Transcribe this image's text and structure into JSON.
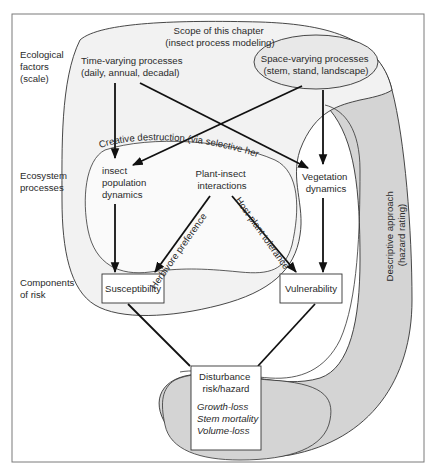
{
  "diagram": {
    "scale_labels": {
      "ecological_factors": [
        "Ecological",
        "factors",
        "(scale)"
      ],
      "ecosystem_processes": [
        "Ecosystem",
        "processes"
      ],
      "components_of_risk": [
        "Components",
        "of risk"
      ]
    },
    "scope": {
      "line1": "Scope of this chapter",
      "line2": "(insect process modeling)"
    },
    "time_varying": {
      "line1": "Time-varying processes",
      "line2": "(daily, annual, decadal)"
    },
    "space_varying": {
      "line1": "Space-varying processes",
      "line2": "(stem, stand, landscape)"
    },
    "creative_destruction": "Creative destruction (via selective herbivory)",
    "insect_population": [
      "insect",
      "population",
      "dynamics"
    ],
    "plant_insect": [
      "Plant-insect",
      "interactions"
    ],
    "vegetation_dynamics": [
      "Vegetation",
      "dynamics"
    ],
    "herbivore_preference": "Herbivore preference",
    "host_plant_tolerance": "Host-plant tolerance",
    "susceptibility": "Susceptibility",
    "vulnerability": "Vulnerability",
    "disturbance": {
      "line1": "Disturbance",
      "line2": "risk/hazard",
      "outcomes": [
        "Growth-loss",
        "Stem mortality",
        "Volume-loss"
      ]
    },
    "descriptive": {
      "line1": "Descriptive approach",
      "line2": "(hazard rating)"
    },
    "colors": {
      "frame": "#7a7a7a",
      "scope_fill": "#f2f2f2",
      "descriptive_fill": "#d4d4d4",
      "inner_fill": "#fafafa",
      "line": "#111111"
    }
  }
}
